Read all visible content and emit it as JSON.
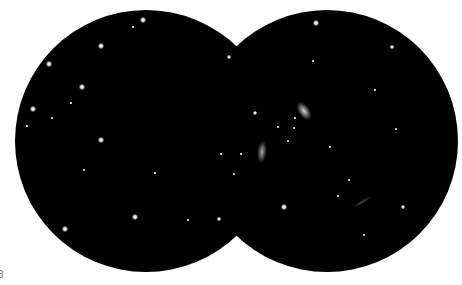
{
  "colors": {
    "background": "#ffffff",
    "field": "#000000",
    "star": "#ffffff",
    "galaxy": "#dcdcdc"
  },
  "corner_label": "3",
  "fields": [
    {
      "name": "left-field",
      "stars": [
        {
          "x": 143,
          "y": 20,
          "mag": "bright"
        },
        {
          "x": 133,
          "y": 27,
          "mag": "faint"
        },
        {
          "x": 101,
          "y": 46,
          "mag": "bright"
        },
        {
          "x": 49,
          "y": 64,
          "mag": "bright"
        },
        {
          "x": 82,
          "y": 87,
          "mag": "bright"
        },
        {
          "x": 71,
          "y": 103,
          "mag": "faint"
        },
        {
          "x": 33,
          "y": 109,
          "mag": "bright"
        },
        {
          "x": 52,
          "y": 118,
          "mag": "faint"
        },
        {
          "x": 27,
          "y": 126,
          "mag": "faint"
        },
        {
          "x": 101,
          "y": 140,
          "mag": "bright"
        },
        {
          "x": 84,
          "y": 170,
          "mag": "faint"
        },
        {
          "x": 155,
          "y": 173,
          "mag": "faint"
        },
        {
          "x": 221,
          "y": 154,
          "mag": "faint"
        },
        {
          "x": 135,
          "y": 217,
          "mag": "bright"
        },
        {
          "x": 65,
          "y": 229,
          "mag": "bright"
        },
        {
          "x": 188,
          "y": 220,
          "mag": "faint"
        },
        {
          "x": 219,
          "y": 219,
          "mag": "medium"
        },
        {
          "x": 229,
          "y": 57,
          "mag": "medium"
        }
      ]
    },
    {
      "name": "right-field",
      "stars": [
        {
          "x": 316,
          "y": 23,
          "mag": "bright"
        },
        {
          "x": 392,
          "y": 47,
          "mag": "medium"
        },
        {
          "x": 313,
          "y": 61,
          "mag": "faint"
        },
        {
          "x": 375,
          "y": 90,
          "mag": "faint"
        },
        {
          "x": 255,
          "y": 113,
          "mag": "medium"
        },
        {
          "x": 396,
          "y": 129,
          "mag": "faint"
        },
        {
          "x": 295,
          "y": 118,
          "mag": "faint"
        },
        {
          "x": 294,
          "y": 128,
          "mag": "faint"
        },
        {
          "x": 288,
          "y": 141,
          "mag": "faint"
        },
        {
          "x": 278,
          "y": 127,
          "mag": "faint"
        },
        {
          "x": 241,
          "y": 154,
          "mag": "faint"
        },
        {
          "x": 234,
          "y": 174,
          "mag": "faint"
        },
        {
          "x": 330,
          "y": 147,
          "mag": "faint"
        },
        {
          "x": 349,
          "y": 180,
          "mag": "faint"
        },
        {
          "x": 338,
          "y": 196,
          "mag": "faint"
        },
        {
          "x": 284,
          "y": 207,
          "mag": "bright"
        },
        {
          "x": 403,
          "y": 207,
          "mag": "medium"
        },
        {
          "x": 364,
          "y": 235,
          "mag": "faint"
        }
      ],
      "galaxies": [
        {
          "name": "galaxy-upper",
          "x": 304,
          "y": 111,
          "rx": 6,
          "ry": 11,
          "angle": -35,
          "brightness": 0.95
        },
        {
          "name": "galaxy-lower",
          "x": 262,
          "y": 152,
          "rx": 5,
          "ry": 12,
          "angle": 5,
          "brightness": 0.75
        },
        {
          "name": "galaxy-edge-on",
          "x": 362,
          "y": 202,
          "rx": 2,
          "ry": 12,
          "angle": 60,
          "brightness": 0.35
        }
      ]
    }
  ]
}
